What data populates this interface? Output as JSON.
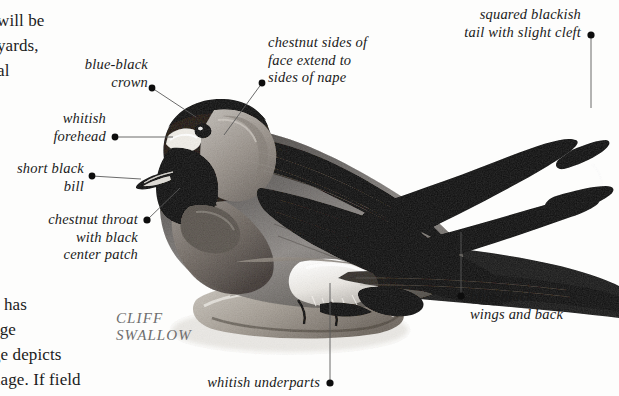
{
  "page": {
    "background_color": "#fdfdfc",
    "width": 619,
    "height": 396
  },
  "body_text": {
    "top_fragment": "will be\nyards,\nal",
    "bottom_fragment": "e has\nage\nge depicts\nnage. If field"
  },
  "species_caption": {
    "text": "CLIFF\nSWALLOW",
    "color": "#6e6e6e"
  },
  "callouts": [
    {
      "id": "blue-black-crown",
      "text": "blue-black\ncrown",
      "align": "right",
      "dot": {
        "x": 152,
        "y": 88
      },
      "target": {
        "x": 196,
        "y": 117
      }
    },
    {
      "id": "chestnut-sides-of-face",
      "text": "chestnut sides of\nface extend to\nsides of nape",
      "align": "left",
      "dot": {
        "x": 262,
        "y": 83
      },
      "target": {
        "x": 224,
        "y": 135
      }
    },
    {
      "id": "squared-blackish-tail",
      "text": "squared blackish\ntail with slight cleft",
      "align": "right",
      "dot": {
        "x": 591,
        "y": 35
      },
      "target": {
        "x": 591,
        "y": 108
      }
    },
    {
      "id": "whitish-forehead",
      "text": "whitish\nforehead",
      "align": "right",
      "dot": {
        "x": 115,
        "y": 137
      },
      "target": {
        "x": 170,
        "y": 137
      }
    },
    {
      "id": "short-black-bill",
      "text": "short black\nbill",
      "align": "right",
      "dot": {
        "x": 92,
        "y": 176
      },
      "target": {
        "x": 140,
        "y": 176
      }
    },
    {
      "id": "chestnut-throat",
      "text": "chestnut throat\nwith black\ncenter patch",
      "align": "right",
      "dot": {
        "x": 147,
        "y": 220
      },
      "target": {
        "x": 178,
        "y": 190
      }
    },
    {
      "id": "blue-black-wings-and-back",
      "text": "blue-black\nwings and back",
      "align": "left",
      "dot": {
        "x": 461,
        "y": 296
      },
      "target": {
        "x": 461,
        "y": 232
      }
    },
    {
      "id": "whitish-underparts",
      "text": "whitish underparts",
      "align": "right",
      "dot": {
        "x": 330,
        "y": 383
      },
      "target": {
        "x": 330,
        "y": 283
      }
    }
  ],
  "colors": {
    "leader_line": "#5a5a5a",
    "dot": "#0d0d0d",
    "text": "#1a1a1a",
    "body_text": "#1b1b1b"
  }
}
